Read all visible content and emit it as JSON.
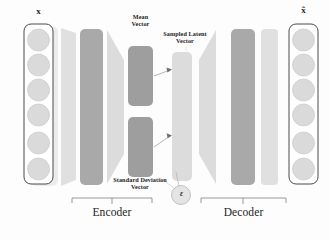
{
  "diagram": {
    "input_label": "x",
    "output_label": "x̂",
    "mean_vector_label": "Mean\nVector",
    "sampled_latent_label": "Sampled Latent\nVector",
    "std_vector_label": "Standard Deviation\nVector",
    "epsilon_label": "ε",
    "encoder_label": "Encoder",
    "decoder_label": "Decoder",
    "input_neuron_count": 6,
    "output_neuron_count": 6,
    "colors": {
      "background": "#fdfdfd",
      "pale_layer": "#e3e3e3",
      "light_layer": "#d7d7d7",
      "dark_layer": "#a8a8a8",
      "medium_layer": "#9e9e9e",
      "latent_layer": "#dcdcdc",
      "neuron_fill": "#d9d9d9",
      "neuron_stroke": "#c2c2c2",
      "outline": "#3a3a3a",
      "text": "#1c1c1c",
      "arrow": "#7a7a7a"
    }
  }
}
